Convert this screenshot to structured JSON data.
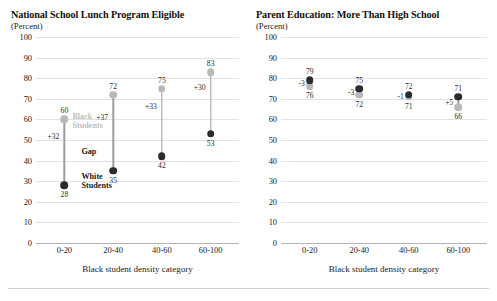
{
  "chart_data": [
    {
      "type": "scatter",
      "title": "National School Lunch Program Eligible",
      "subtitle": "(Percent)",
      "xlabel": "Black student density category",
      "ylabel": "",
      "ylim": [
        0,
        100
      ],
      "yticks": [
        0,
        10,
        20,
        30,
        40,
        50,
        60,
        70,
        80,
        90,
        100
      ],
      "categories": [
        "0-20",
        "20-40",
        "40-60",
        "60-100"
      ],
      "grid": true,
      "legend_position": "inline-annotations",
      "series": [
        {
          "name": "Black Students",
          "color": "#b9b9b9",
          "values": [
            60,
            72,
            75,
            83
          ]
        },
        {
          "name": "White Students",
          "color": "#2b2b2b",
          "values": [
            28,
            35,
            42,
            53
          ]
        }
      ],
      "gap_labels": [
        "+32",
        "+37",
        "+33",
        "+30"
      ],
      "annotations": [
        {
          "text": "Black Students",
          "kind": "black-legend"
        },
        {
          "text": "Gap",
          "kind": "gap-legend"
        },
        {
          "text": "White Students",
          "kind": "white-legend"
        }
      ]
    },
    {
      "type": "scatter",
      "title": "Parent Education: More Than High School",
      "subtitle": "(Percent)",
      "xlabel": "Black student density category",
      "ylabel": "",
      "ylim": [
        0,
        100
      ],
      "yticks": [
        0,
        10,
        20,
        30,
        40,
        50,
        60,
        70,
        80,
        90,
        100
      ],
      "categories": [
        "0-20",
        "20-40",
        "40-60",
        "60-100"
      ],
      "grid": true,
      "legend_position": "none",
      "series": [
        {
          "name": "Black Students",
          "color": "#b9b9b9",
          "values": [
            76,
            72,
            71,
            66
          ]
        },
        {
          "name": "White Students",
          "color": "#2b2b2b",
          "values": [
            79,
            75,
            72,
            71
          ]
        }
      ],
      "gap_labels": [
        "-3",
        "-3",
        "-1",
        "+5"
      ]
    }
  ],
  "chart_left": {
    "title": "National School Lunch Program Eligible",
    "subtitle": "(Percent)",
    "xlabel": "Black student density category",
    "yticks": [
      "100",
      "90",
      "80",
      "70",
      "60",
      "50",
      "40",
      "30",
      "20",
      "10",
      "0"
    ],
    "xticks": [
      "0-20",
      "20-40",
      "40-60",
      "60-100"
    ],
    "points": [
      {
        "black": "60",
        "white": "28",
        "gap": "+32"
      },
      {
        "black": "72",
        "white": "35",
        "gap": "+37"
      },
      {
        "black": "75",
        "white": "42",
        "gap": "+33"
      },
      {
        "black": "83",
        "white": "53",
        "gap": "+30"
      }
    ],
    "legend": {
      "black_line1": "Black",
      "black_line2": "Students",
      "gap": "Gap",
      "white_line1": "White",
      "white_line2": "Students"
    }
  },
  "chart_right": {
    "title": "Parent Education: More Than High School",
    "subtitle": "(Percent)",
    "xlabel": "Black student density category",
    "yticks": [
      "100",
      "90",
      "80",
      "70",
      "60",
      "50",
      "40",
      "30",
      "20",
      "10",
      "0"
    ],
    "xticks": [
      "0-20",
      "20-40",
      "40-60",
      "60-100"
    ],
    "points": [
      {
        "white": "79",
        "black": "76",
        "gap": "-3"
      },
      {
        "white": "75",
        "black": "72",
        "gap": "-3"
      },
      {
        "white": "72",
        "black": "71",
        "gap": "-1"
      },
      {
        "black": "66",
        "white": "71",
        "gap": "+5"
      }
    ]
  },
  "colors": {
    "black_students": "#b9b9b9",
    "white_students": "#2b2b2b",
    "gridline": "#e2e2e2",
    "axis": "#b4b4b4"
  },
  "footnote": " "
}
